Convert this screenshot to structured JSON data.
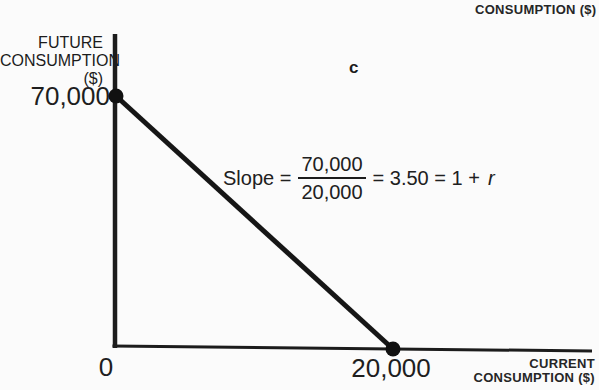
{
  "colors": {
    "ink": "#1c1c1c"
  },
  "figure": {
    "panel_label": "c",
    "top_right_label": "CONSUMPTION ($)",
    "y_axis": {
      "label_lines": [
        "FUTURE",
        "CONSUMPTION",
        "($)"
      ],
      "tick_label": "70,000"
    },
    "x_axis": {
      "label_lines": [
        "CURRENT",
        "CONSUMPTION ($)"
      ],
      "origin_label": "0",
      "tick_label": "20,000"
    },
    "equation": {
      "prefix": "Slope =",
      "numerator": "70,000",
      "denominator": "20,000",
      "suffix": "= 3.50 = 1 +",
      "rate_symbol": "r"
    }
  },
  "chart_data": {
    "type": "line",
    "title": "",
    "panel": "c",
    "xlabel": "CURRENT CONSUMPTION ($)",
    "ylabel": "FUTURE CONSUMPTION ($)",
    "points": [
      {
        "x": 0,
        "y": 70000
      },
      {
        "x": 20000,
        "y": 0
      }
    ],
    "x_ticks": [
      {
        "value": 0,
        "label": "0"
      },
      {
        "value": 20000,
        "label": "20,000"
      }
    ],
    "y_ticks": [
      {
        "value": 70000,
        "label": "70,000"
      }
    ],
    "xlim": [
      0,
      34500
    ],
    "ylim": [
      0,
      88000
    ],
    "grid": false,
    "legend": "none",
    "annotations": [
      "Slope = 70,000/20,000 = 3.50 = 1 + r"
    ],
    "slope": 3.5,
    "interest_rate_relation": "1 + r"
  }
}
